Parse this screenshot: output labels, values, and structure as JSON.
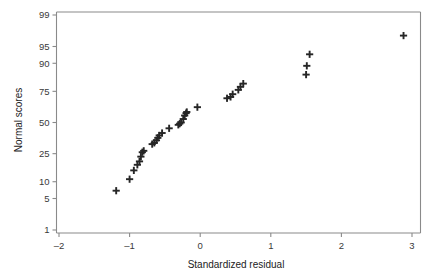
{
  "chart_data": {
    "type": "scatter",
    "title": "",
    "xlabel": "Standardized residual",
    "ylabel": "Normal scores",
    "xlim": [
      -2,
      3
    ],
    "ylim_probability": [
      1,
      99
    ],
    "grid": false,
    "legend": null,
    "y_scale": "normal probability",
    "xticks": [
      -2,
      -1,
      0,
      1,
      2,
      3
    ],
    "xtick_labels": [
      "–2",
      "–1",
      "0",
      "1",
      "2",
      "3"
    ],
    "yticks": [
      1,
      5,
      10,
      25,
      50,
      75,
      90,
      95,
      99
    ],
    "ytick_labels": [
      "1",
      "5",
      "10",
      "25",
      "50",
      "75",
      "90",
      "95",
      "99"
    ],
    "marker": "plus",
    "marker_color": "#262626",
    "points": [
      {
        "x": -1.19,
        "y": 7
      },
      {
        "x": -1.0,
        "y": 11
      },
      {
        "x": -0.94,
        "y": 15
      },
      {
        "x": -0.89,
        "y": 18
      },
      {
        "x": -0.86,
        "y": 20
      },
      {
        "x": -0.84,
        "y": 23
      },
      {
        "x": -0.82,
        "y": 26
      },
      {
        "x": -0.8,
        "y": 27
      },
      {
        "x": -0.68,
        "y": 32
      },
      {
        "x": -0.65,
        "y": 33
      },
      {
        "x": -0.62,
        "y": 35
      },
      {
        "x": -0.6,
        "y": 37
      },
      {
        "x": -0.58,
        "y": 39
      },
      {
        "x": -0.54,
        "y": 41
      },
      {
        "x": -0.44,
        "y": 45
      },
      {
        "x": -0.31,
        "y": 48
      },
      {
        "x": -0.29,
        "y": 49
      },
      {
        "x": -0.27,
        "y": 50
      },
      {
        "x": -0.24,
        "y": 53
      },
      {
        "x": -0.22,
        "y": 56
      },
      {
        "x": -0.2,
        "y": 58
      },
      {
        "x": -0.19,
        "y": 59
      },
      {
        "x": -0.04,
        "y": 63
      },
      {
        "x": 0.38,
        "y": 70
      },
      {
        "x": 0.43,
        "y": 71
      },
      {
        "x": 0.46,
        "y": 73
      },
      {
        "x": 0.54,
        "y": 76
      },
      {
        "x": 0.57,
        "y": 78
      },
      {
        "x": 0.61,
        "y": 80
      },
      {
        "x": 1.5,
        "y": 85
      },
      {
        "x": 1.51,
        "y": 89
      },
      {
        "x": 1.55,
        "y": 93
      },
      {
        "x": 2.88,
        "y": 97
      }
    ]
  },
  "figure": {
    "background_color": "#ffffff",
    "axis_color": "#8a8a8a",
    "text_color": "#3a3a3a"
  }
}
